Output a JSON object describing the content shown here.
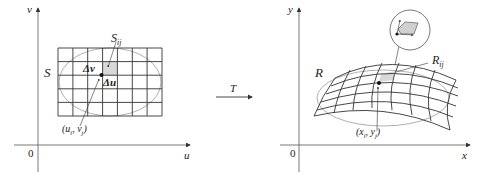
{
  "left_panel": {
    "axis_v_label": "v",
    "axis_u_label": "u",
    "origin_label": "0",
    "region_label": "S",
    "subregion_label": "S",
    "subregion_sub": "ij",
    "delta_v_label": "Δv",
    "delta_u_label": "Δu",
    "point_label": "(u",
    "point_label_i": "i",
    "point_label_mid": ", v",
    "point_label_j": "j",
    "point_label_end": ")",
    "grid": {
      "cols": 7,
      "rows": 5,
      "x0": 58,
      "y0": 48,
      "x1": 162,
      "y1": 116
    }
  },
  "transform": {
    "label": "T"
  },
  "right_panel": {
    "axis_y_label": "y",
    "axis_x_label": "x",
    "origin_label": "0",
    "region_label": "R",
    "subregion_label": "R",
    "subregion_sub": "ij",
    "point_label": "(x",
    "point_label_i": "i",
    "point_label_mid": ", y",
    "point_label_j": "j",
    "point_label_end": ")"
  },
  "colors": {
    "line": "#333333",
    "ellipse": "#aaaaaa",
    "shade": "#d8d8d8",
    "axis": "#444444"
  }
}
